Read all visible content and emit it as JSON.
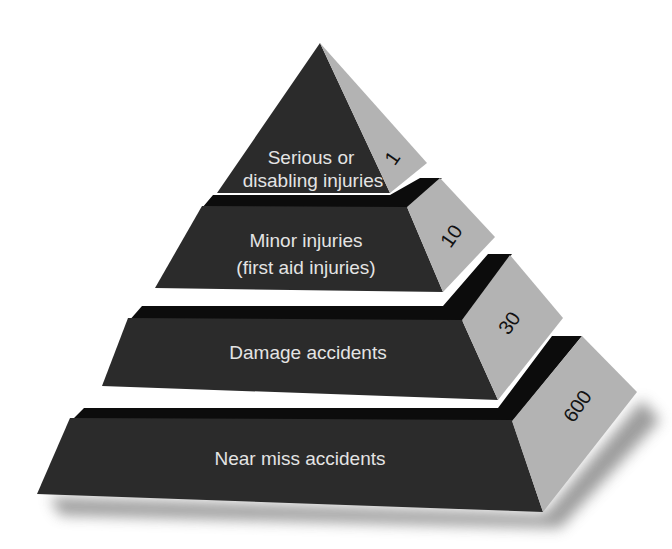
{
  "colors": {
    "front_face": "#2b2b2b",
    "separator_band": "#0c0c0c",
    "side_face": "#b3b3b3",
    "label_text": "#e4e4e4",
    "number_text": "#111111",
    "background": "#ffffff"
  },
  "tiers": [
    {
      "label_lines": [
        "Serious or",
        "disabling injuries"
      ],
      "count": "1"
    },
    {
      "label_lines": [
        "Minor injuries",
        "(first aid injuries)"
      ],
      "count": "10"
    },
    {
      "label_lines": [
        "Damage accidents"
      ],
      "count": "30"
    },
    {
      "label_lines": [
        "Near miss accidents"
      ],
      "count": "600"
    }
  ]
}
